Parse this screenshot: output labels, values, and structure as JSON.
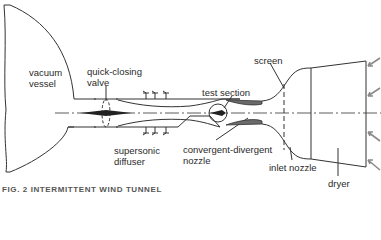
{
  "diagram": {
    "type": "schematic",
    "labels": {
      "vacuum_vessel": [
        "vacuum",
        "vessel"
      ],
      "quick_closing_valve": [
        "quick-closing",
        "valve"
      ],
      "supersonic_diffuser": [
        "supersonic",
        "diffuser"
      ],
      "test_section": "test section",
      "convergent_divergent_nozzle": [
        "convergent-divergent",
        "nozzle"
      ],
      "screen": "screen",
      "inlet_nozzle": "inlet nozzle",
      "dryer": "dryer"
    },
    "caption": "FIG. 2   INTERMITTENT WIND TUNNEL",
    "flow_direction": "right-to-left (air enters through dryer, exits into vacuum vessel)",
    "colors": {
      "line": "#333333",
      "fill_nozzle": "#6a6a6a",
      "arrow": "#8a8a8a",
      "background": "#ffffff"
    }
  }
}
